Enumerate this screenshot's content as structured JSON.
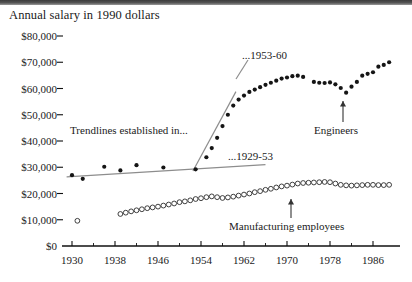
{
  "chart_data": {
    "type": "scatter",
    "title": "Annual salary in 1990 dollars",
    "xlabel": "",
    "ylabel": "",
    "xlim": [
      1929,
      1990
    ],
    "ylim": [
      0,
      80000
    ],
    "xticks": [
      1930,
      1938,
      1946,
      1954,
      1962,
      1970,
      1978,
      1986
    ],
    "xtick_labels": [
      "1930",
      "1938",
      "1946",
      "1954",
      "1962",
      "1970",
      "1978",
      "1986"
    ],
    "yticks": [
      0,
      10000,
      20000,
      30000,
      40000,
      50000,
      60000,
      70000,
      80000
    ],
    "ytick_labels": [
      "$0",
      "$10,000",
      "$20,000",
      "$30,000",
      "$40,000",
      "$50,000",
      "$60,000",
      "$70,000",
      "$80,000"
    ],
    "grid": false,
    "legend": "none",
    "series": [
      {
        "name": "Engineers",
        "marker": "filled-circle",
        "points": [
          [
            1930,
            27000
          ],
          [
            1932,
            25600
          ],
          [
            1936,
            30200
          ],
          [
            1939,
            28800
          ],
          [
            1942,
            30800
          ],
          [
            1947,
            29900
          ],
          [
            1953,
            29200
          ],
          [
            1955,
            33800
          ],
          [
            1956,
            37300
          ],
          [
            1957,
            41200
          ],
          [
            1958,
            45700
          ],
          [
            1959,
            50000
          ],
          [
            1960,
            53500
          ],
          [
            1961,
            55800
          ],
          [
            1962,
            57300
          ],
          [
            1963,
            58700
          ],
          [
            1964,
            59600
          ],
          [
            1965,
            60500
          ],
          [
            1966,
            61400
          ],
          [
            1967,
            62200
          ],
          [
            1968,
            63000
          ],
          [
            1969,
            63800
          ],
          [
            1970,
            64200
          ],
          [
            1971,
            64700
          ],
          [
            1972,
            64900
          ],
          [
            1973,
            64400
          ],
          [
            1975,
            62500
          ],
          [
            1976,
            62200
          ],
          [
            1977,
            62100
          ],
          [
            1978,
            62300
          ],
          [
            1979,
            61600
          ],
          [
            1980,
            60200
          ],
          [
            1981,
            58400
          ],
          [
            1982,
            60700
          ],
          [
            1983,
            62500
          ],
          [
            1984,
            64900
          ],
          [
            1985,
            65600
          ],
          [
            1986,
            66200
          ],
          [
            1987,
            68300
          ],
          [
            1988,
            69000
          ],
          [
            1989,
            70000
          ]
        ]
      },
      {
        "name": "Manufacturing employees",
        "marker": "open-circle",
        "points": [
          [
            1931,
            9600
          ],
          [
            1939,
            12200
          ],
          [
            1940,
            12700
          ],
          [
            1941,
            13200
          ],
          [
            1942,
            13600
          ],
          [
            1943,
            14000
          ],
          [
            1944,
            14400
          ],
          [
            1945,
            14700
          ],
          [
            1946,
            15000
          ],
          [
            1947,
            15400
          ],
          [
            1948,
            15800
          ],
          [
            1949,
            16200
          ],
          [
            1950,
            16700
          ],
          [
            1951,
            17000
          ],
          [
            1952,
            17400
          ],
          [
            1953,
            17900
          ],
          [
            1954,
            18200
          ],
          [
            1955,
            18600
          ],
          [
            1956,
            18900
          ],
          [
            1957,
            18600
          ],
          [
            1958,
            18300
          ],
          [
            1959,
            18500
          ],
          [
            1960,
            18800
          ],
          [
            1961,
            19200
          ],
          [
            1962,
            19600
          ],
          [
            1963,
            20000
          ],
          [
            1964,
            20500
          ],
          [
            1965,
            20900
          ],
          [
            1966,
            21400
          ],
          [
            1967,
            21800
          ],
          [
            1968,
            22300
          ],
          [
            1969,
            22700
          ],
          [
            1970,
            23000
          ],
          [
            1971,
            23400
          ],
          [
            1972,
            23800
          ],
          [
            1973,
            24000
          ],
          [
            1974,
            24100
          ],
          [
            1975,
            24200
          ],
          [
            1976,
            24300
          ],
          [
            1977,
            24400
          ],
          [
            1978,
            24300
          ],
          [
            1979,
            23800
          ],
          [
            1980,
            23300
          ],
          [
            1981,
            23100
          ],
          [
            1982,
            23000
          ],
          [
            1983,
            23100
          ],
          [
            1984,
            23200
          ],
          [
            1985,
            23300
          ],
          [
            1986,
            23300
          ],
          [
            1987,
            23200
          ],
          [
            1988,
            23200
          ],
          [
            1989,
            23300
          ]
        ]
      }
    ],
    "trendlines": [
      {
        "label": "...1929-53",
        "from": [
          1929,
          26300
        ],
        "to": [
          1966,
          31000
        ]
      },
      {
        "label": "...1953-60",
        "from": [
          1952.5,
          28600
        ],
        "to": [
          1960.5,
          58800
        ]
      }
    ],
    "annotations": [
      {
        "text": "Trendlines established in...",
        "role": "trendline-intro"
      },
      {
        "text": "...1929-53",
        "role": "trendline-1929-53-label"
      },
      {
        "text": "...1953-60",
        "role": "trendline-1953-60-label"
      },
      {
        "text": "Engineers",
        "role": "series-callout-engineers"
      },
      {
        "text": "Manufacturing employees",
        "role": "series-callout-manufacturing"
      }
    ]
  },
  "colors": {
    "ink": "#151515",
    "trendline": "#8d8d8d",
    "paper": "#ffffff"
  }
}
